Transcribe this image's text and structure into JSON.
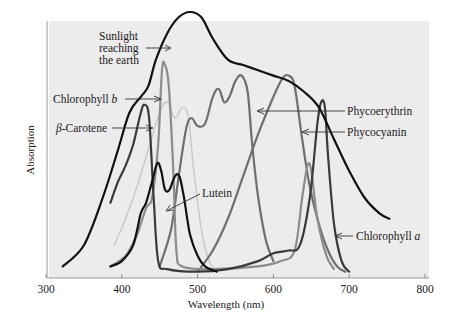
{
  "chart_data": {
    "type": "line",
    "title": "",
    "xlabel": "Wavelength (nm)",
    "ylabel": "Absorption",
    "xlim": [
      300,
      800
    ],
    "xticks": [
      300,
      400,
      500,
      600,
      700,
      800
    ],
    "ylim": [
      0,
      1
    ],
    "grid": false,
    "legend": "inline annotations with arrows",
    "series": [
      {
        "name": "Sunlight reaching the earth",
        "color": "#111111",
        "width": 2.2,
        "points": [
          [
            322,
            0.04
          ],
          [
            350,
            0.12
          ],
          [
            375,
            0.3
          ],
          [
            395,
            0.48
          ],
          [
            410,
            0.62
          ],
          [
            425,
            0.68
          ],
          [
            435,
            0.72
          ],
          [
            445,
            0.82
          ],
          [
            460,
            0.92
          ],
          [
            475,
            0.98
          ],
          [
            490,
            1.0
          ],
          [
            505,
            0.98
          ],
          [
            520,
            0.9
          ],
          [
            540,
            0.82
          ],
          [
            560,
            0.8
          ],
          [
            580,
            0.78
          ],
          [
            600,
            0.76
          ],
          [
            620,
            0.74
          ],
          [
            640,
            0.7
          ],
          [
            660,
            0.64
          ],
          [
            680,
            0.52
          ],
          [
            700,
            0.4
          ],
          [
            720,
            0.3
          ],
          [
            740,
            0.24
          ],
          [
            753,
            0.22
          ]
        ]
      },
      {
        "name": "Chlorophyll b",
        "color": "#8c8c8c",
        "width": 2.2,
        "points": [
          [
            385,
            0.04
          ],
          [
            405,
            0.08
          ],
          [
            420,
            0.16
          ],
          [
            432,
            0.26
          ],
          [
            440,
            0.3
          ],
          [
            448,
            0.5
          ],
          [
            453,
            0.78
          ],
          [
            457,
            0.8
          ],
          [
            462,
            0.72
          ],
          [
            468,
            0.4
          ],
          [
            472,
            0.1
          ],
          [
            480,
            0.04
          ],
          [
            520,
            0.03
          ],
          [
            580,
            0.04
          ],
          [
            610,
            0.06
          ],
          [
            628,
            0.1
          ],
          [
            638,
            0.3
          ],
          [
            645,
            0.42
          ],
          [
            650,
            0.4
          ],
          [
            658,
            0.22
          ],
          [
            670,
            0.08
          ],
          [
            680,
            0.03
          ]
        ]
      },
      {
        "name": "Chlorophyll a",
        "color": "#3a3a3a",
        "width": 2.2,
        "points": [
          [
            385,
            0.28
          ],
          [
            395,
            0.36
          ],
          [
            405,
            0.42
          ],
          [
            415,
            0.5
          ],
          [
            425,
            0.62
          ],
          [
            430,
            0.65
          ],
          [
            436,
            0.6
          ],
          [
            442,
            0.3
          ],
          [
            448,
            0.06
          ],
          [
            460,
            0.03
          ],
          [
            500,
            0.02
          ],
          [
            540,
            0.03
          ],
          [
            580,
            0.06
          ],
          [
            600,
            0.09
          ],
          [
            620,
            0.1
          ],
          [
            635,
            0.12
          ],
          [
            648,
            0.3
          ],
          [
            658,
            0.58
          ],
          [
            663,
            0.66
          ],
          [
            668,
            0.64
          ],
          [
            672,
            0.46
          ],
          [
            680,
            0.2
          ],
          [
            690,
            0.06
          ],
          [
            700,
            0.02
          ]
        ]
      },
      {
        "name": "β-Carotene",
        "color": "#c8c8c8",
        "width": 1.4,
        "points": [
          [
            390,
            0.12
          ],
          [
            405,
            0.22
          ],
          [
            420,
            0.34
          ],
          [
            435,
            0.48
          ],
          [
            450,
            0.62
          ],
          [
            460,
            0.66
          ],
          [
            470,
            0.6
          ],
          [
            480,
            0.64
          ],
          [
            488,
            0.6
          ],
          [
            495,
            0.4
          ],
          [
            505,
            0.18
          ],
          [
            515,
            0.06
          ],
          [
            525,
            0.02
          ]
        ]
      },
      {
        "name": "Lutein",
        "color": "#111111",
        "width": 2.2,
        "points": [
          [
            385,
            0.04
          ],
          [
            400,
            0.06
          ],
          [
            415,
            0.12
          ],
          [
            425,
            0.24
          ],
          [
            432,
            0.28
          ],
          [
            440,
            0.36
          ],
          [
            447,
            0.43
          ],
          [
            452,
            0.4
          ],
          [
            457,
            0.33
          ],
          [
            463,
            0.33
          ],
          [
            470,
            0.38
          ],
          [
            476,
            0.38
          ],
          [
            482,
            0.3
          ],
          [
            490,
            0.16
          ],
          [
            500,
            0.08
          ],
          [
            510,
            0.04
          ],
          [
            525,
            0.02
          ]
        ]
      },
      {
        "name": "Phycoerythrin",
        "color": "#6f6f6f",
        "width": 2.2,
        "points": [
          [
            450,
            0.04
          ],
          [
            465,
            0.18
          ],
          [
            475,
            0.38
          ],
          [
            485,
            0.56
          ],
          [
            492,
            0.6
          ],
          [
            500,
            0.57
          ],
          [
            510,
            0.58
          ],
          [
            520,
            0.68
          ],
          [
            528,
            0.71
          ],
          [
            535,
            0.66
          ],
          [
            542,
            0.68
          ],
          [
            550,
            0.74
          ],
          [
            558,
            0.76
          ],
          [
            566,
            0.7
          ],
          [
            572,
            0.5
          ],
          [
            580,
            0.3
          ],
          [
            590,
            0.14
          ],
          [
            600,
            0.06
          ]
        ]
      },
      {
        "name": "Phycocyanin",
        "color": "#6f6f6f",
        "width": 2.2,
        "points": [
          [
            500,
            0.02
          ],
          [
            520,
            0.1
          ],
          [
            540,
            0.22
          ],
          [
            560,
            0.38
          ],
          [
            580,
            0.54
          ],
          [
            600,
            0.68
          ],
          [
            612,
            0.75
          ],
          [
            620,
            0.76
          ],
          [
            628,
            0.72
          ],
          [
            638,
            0.52
          ],
          [
            648,
            0.34
          ],
          [
            660,
            0.2
          ],
          [
            672,
            0.1
          ],
          [
            684,
            0.04
          ],
          [
            695,
            0.02
          ]
        ]
      }
    ],
    "annotations": [
      {
        "text": [
          "Sunlight",
          "reaching",
          "the earth"
        ],
        "target_nm": 482
      },
      {
        "text": "Chlorophyll b",
        "target_nm": 455
      },
      {
        "text": "β-Carotene",
        "target_nm": 450
      },
      {
        "text": "Lutein",
        "target_nm": 460
      },
      {
        "text": "Phycoerythrin",
        "target_nm": 570
      },
      {
        "text": "Phycocyanin",
        "target_nm": 634
      },
      {
        "text": "Chlorophyll a",
        "target_nm": 678
      }
    ]
  },
  "labels": {
    "sunlight": [
      "Sunlight",
      "reaching",
      "the earth"
    ],
    "chl_b_prefix": "Chlorophyll ",
    "chl_b_italic": "b",
    "carotene_italic": "β",
    "carotene_rest": "-Carotene",
    "lutein": "Lutein",
    "phycoerythrin": "Phycoerythrin",
    "phycocyanin": "Phycocyanin",
    "chl_a_prefix": "Chlorophyll ",
    "chl_a_italic": "a"
  },
  "axes": {
    "xlabel": "Wavelength (nm)",
    "ylabel": "Absorption",
    "ticks": [
      "300",
      "400",
      "500",
      "600",
      "700",
      "800"
    ]
  },
  "colors": {
    "plot_bg": "#ececec",
    "axis": "#8a8a8a"
  }
}
